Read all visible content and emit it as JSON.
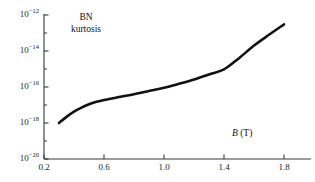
{
  "chart_data": {
    "type": "line",
    "title": "",
    "annotation": {
      "line1": "BN",
      "line2": "kurtosis"
    },
    "xlabel_symbol": "B",
    "xlabel_unit": "(T)",
    "xlabel": "B (T)",
    "ylabel": "",
    "xscale": "linear",
    "yscale": "log",
    "xlim": [
      0.2,
      1.85
    ],
    "ylim": [
      1e-20,
      1e-12
    ],
    "grid": false,
    "legend": null,
    "x_ticks": [
      {
        "value": 0.2,
        "label": "0.2"
      },
      {
        "value": 0.6,
        "label": "0.6"
      },
      {
        "value": 1.0,
        "label": "1.0"
      },
      {
        "value": 1.4,
        "label": "1.4"
      },
      {
        "value": 1.8,
        "label": "1.8"
      }
    ],
    "y_ticks": [
      {
        "value": 1e-12,
        "mantissa": "10",
        "exponent": "−12"
      },
      {
        "value": 1e-14,
        "mantissa": "10",
        "exponent": "−14"
      },
      {
        "value": 1e-16,
        "mantissa": "10",
        "exponent": "−16"
      },
      {
        "value": 1e-18,
        "mantissa": "10",
        "exponent": "−18"
      },
      {
        "value": 1e-20,
        "mantissa": "10",
        "exponent": "−20"
      }
    ],
    "y_minor_ticks": [
      1e-13,
      1e-15,
      1e-17,
      1e-19
    ],
    "series": [
      {
        "name": "BN kurtosis",
        "color": "#111111",
        "linewidth": 2.6,
        "x": [
          0.3,
          0.35,
          0.4,
          0.45,
          0.5,
          0.55,
          0.6,
          0.7,
          0.8,
          0.9,
          1.0,
          1.1,
          1.2,
          1.3,
          1.4,
          1.5,
          1.6,
          1.7,
          1.8
        ],
        "y": [
          1e-18,
          2.2e-18,
          4.3e-18,
          7.2e-18,
          1.1e-17,
          1.5e-17,
          1.9e-17,
          2.8e-17,
          4e-17,
          6e-17,
          9e-17,
          1.5e-16,
          2.6e-16,
          5e-16,
          9.5e-16,
          4e-15,
          2e-14,
          8e-14,
          3e-13
        ]
      }
    ]
  }
}
